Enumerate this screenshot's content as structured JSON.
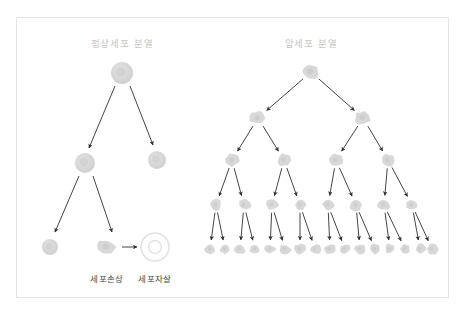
{
  "figure": {
    "background": "#ffffff",
    "frame_color": "#e6e6e6",
    "title_color": "#c6c6c6",
    "caption_color": "#4a4a4a",
    "arrow_color": "#2f2f2f",
    "normal_cell_color": "#d4d4d4",
    "cancer_cell_color": "#d8d8d8",
    "apoptosis_ring_color": "#e2e2e2"
  },
  "panels": {
    "left": {
      "title": "정상세포 분열",
      "title_x": 122,
      "title_y": 36,
      "captions": [
        {
          "text": "세포손상",
          "x": 107,
          "y": 272
        },
        {
          "text": "세포자살",
          "x": 155,
          "y": 272
        }
      ]
    },
    "right": {
      "title": "암세포 분열",
      "title_x": 311,
      "title_y": 36
    }
  },
  "chart_data": {
    "type": "diagram",
    "normal_division": {
      "label": "정상세포 분열",
      "generations": [
        1,
        2,
        2
      ],
      "outcome": [
        "세포손상",
        "세포자살"
      ],
      "cells": [
        {
          "id": "n0",
          "x": 122,
          "y": 73,
          "r": 11,
          "kind": "normal"
        },
        {
          "id": "n1",
          "x": 85,
          "y": 163,
          "r": 10,
          "kind": "normal"
        },
        {
          "id": "n2",
          "x": 157,
          "y": 160,
          "r": 9,
          "kind": "normal"
        },
        {
          "id": "n3",
          "x": 50,
          "y": 247,
          "r": 8,
          "kind": "normal"
        },
        {
          "id": "n4",
          "x": 107,
          "y": 247,
          "r": 9,
          "kind": "damaged"
        },
        {
          "id": "n5",
          "x": 155,
          "y": 247,
          "r": 14,
          "kind": "apoptosis-ring"
        }
      ],
      "arrows": [
        {
          "x1": 115,
          "y1": 86,
          "x2": 89,
          "y2": 148
        },
        {
          "x1": 130,
          "y1": 86,
          "x2": 153,
          "y2": 145
        },
        {
          "x1": 79,
          "y1": 176,
          "x2": 55,
          "y2": 232
        },
        {
          "x1": 93,
          "y1": 176,
          "x2": 112,
          "y2": 232
        },
        {
          "x1": 122,
          "y1": 247,
          "x2": 137,
          "y2": 247
        }
      ]
    },
    "cancer_division": {
      "label": "암세포 분열",
      "generations": [
        1,
        2,
        4,
        8,
        16
      ],
      "levels": [
        {
          "level": 1,
          "y": 72,
          "r": 9.0,
          "xs": [
            311
          ]
        },
        {
          "level": 2,
          "y": 118,
          "r": 8.0,
          "xs": [
            258,
            363
          ]
        },
        {
          "level": 3,
          "y": 160,
          "r": 7.0,
          "xs": [
            232,
            284,
            336,
            388
          ]
        },
        {
          "level": 4,
          "y": 205,
          "r": 6.2,
          "xs": [
            216,
            244,
            272,
            300,
            328,
            356,
            384,
            412
          ]
        },
        {
          "level": 5,
          "y": 249,
          "r": 5.6,
          "xs": [
            210,
            225,
            240,
            255,
            270,
            285,
            300,
            315,
            330,
            345,
            360,
            375,
            390,
            405,
            420,
            432
          ]
        }
      ]
    }
  }
}
